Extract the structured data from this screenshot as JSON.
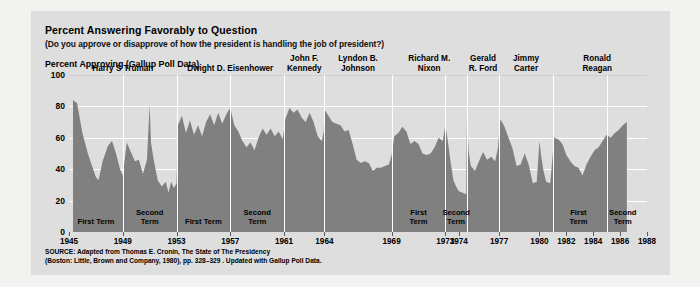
{
  "title": "Percent Answering Favorably to Question",
  "subtitle": "(Do you approve or disapprove of how the president is handling the job of president?)",
  "axis_title": "Percent Approving (Gallup Poll Data)",
  "source": "SOURCE: Adapted from Thomas E. Cronin, The State of The Presidency\n(Boston: Little, Brown and Company, 1980), pp. 328–329 . Updated with Gallup Poll Data.",
  "colors": {
    "page_background": "#f2f2f0",
    "panel_background": "#dedede",
    "area_fill": "#808080",
    "gridline": "#ffffff",
    "text": "#000000"
  },
  "chart_data": {
    "type": "area",
    "title": "Percent Answering Favorably to Question",
    "subtitle": "(Do you approve or disapprove of how the president is handling the job of president?)",
    "xlabel": "",
    "ylabel": "Percent Approving (Gallup Poll Data)",
    "ylim": [
      0,
      100
    ],
    "xlim": [
      1945,
      1988
    ],
    "grid": true,
    "legend": "none",
    "yticks": [
      0,
      20,
      40,
      60,
      80,
      100
    ],
    "xticks": [
      1945,
      1949,
      1953,
      1957,
      1961,
      1964,
      1969,
      1973,
      1974,
      1977,
      1980,
      1982,
      1984,
      1986,
      1988
    ],
    "series_name": "Presidential approval (Gallup)",
    "points": [
      [
        1945.3,
        84
      ],
      [
        1945.6,
        82
      ],
      [
        1946.0,
        63
      ],
      [
        1946.4,
        50
      ],
      [
        1946.8,
        40
      ],
      [
        1947.0,
        35
      ],
      [
        1947.2,
        33
      ],
      [
        1947.5,
        45
      ],
      [
        1947.9,
        55
      ],
      [
        1948.2,
        58
      ],
      [
        1948.5,
        50
      ],
      [
        1948.8,
        40
      ],
      [
        1949.0,
        36
      ],
      [
        1949.3,
        57
      ],
      [
        1949.6,
        51
      ],
      [
        1949.9,
        45
      ],
      [
        1950.2,
        46
      ],
      [
        1950.5,
        37
      ],
      [
        1950.8,
        46
      ],
      [
        1951.0,
        81
      ],
      [
        1951.1,
        57
      ],
      [
        1951.3,
        46
      ],
      [
        1951.6,
        33
      ],
      [
        1951.9,
        29
      ],
      [
        1952.2,
        32
      ],
      [
        1952.4,
        25
      ],
      [
        1952.6,
        32
      ],
      [
        1952.8,
        28
      ],
      [
        1953.0,
        31
      ],
      [
        1953.1,
        68
      ],
      [
        1953.4,
        74
      ],
      [
        1953.7,
        63
      ],
      [
        1954.0,
        71
      ],
      [
        1954.3,
        62
      ],
      [
        1954.6,
        68
      ],
      [
        1954.9,
        61
      ],
      [
        1955.2,
        70
      ],
      [
        1955.5,
        75
      ],
      [
        1955.8,
        68
      ],
      [
        1956.1,
        76
      ],
      [
        1956.4,
        69
      ],
      [
        1956.7,
        75
      ],
      [
        1957.0,
        79
      ],
      [
        1957.3,
        68
      ],
      [
        1957.6,
        64
      ],
      [
        1957.9,
        58
      ],
      [
        1958.2,
        54
      ],
      [
        1958.5,
        57
      ],
      [
        1958.8,
        52
      ],
      [
        1959.1,
        60
      ],
      [
        1959.4,
        66
      ],
      [
        1959.7,
        62
      ],
      [
        1960.0,
        66
      ],
      [
        1960.3,
        61
      ],
      [
        1960.6,
        64
      ],
      [
        1960.9,
        59
      ],
      [
        1961.1,
        72
      ],
      [
        1961.4,
        79
      ],
      [
        1961.7,
        76
      ],
      [
        1962.0,
        78
      ],
      [
        1962.3,
        73
      ],
      [
        1962.6,
        70
      ],
      [
        1962.9,
        76
      ],
      [
        1963.2,
        70
      ],
      [
        1963.5,
        61
      ],
      [
        1963.8,
        58
      ],
      [
        1963.95,
        64
      ],
      [
        1964.0,
        78
      ],
      [
        1964.3,
        74
      ],
      [
        1964.6,
        70
      ],
      [
        1964.9,
        69
      ],
      [
        1965.2,
        68
      ],
      [
        1965.5,
        64
      ],
      [
        1965.8,
        65
      ],
      [
        1966.1,
        56
      ],
      [
        1966.4,
        46
      ],
      [
        1966.7,
        44
      ],
      [
        1967.0,
        45
      ],
      [
        1967.3,
        44
      ],
      [
        1967.6,
        39
      ],
      [
        1967.9,
        41
      ],
      [
        1968.2,
        41
      ],
      [
        1968.5,
        42
      ],
      [
        1968.8,
        43
      ],
      [
        1969.0,
        49
      ],
      [
        1969.2,
        61
      ],
      [
        1969.5,
        63
      ],
      [
        1969.8,
        67
      ],
      [
        1970.1,
        64
      ],
      [
        1970.4,
        56
      ],
      [
        1970.7,
        58
      ],
      [
        1971.0,
        56
      ],
      [
        1971.3,
        50
      ],
      [
        1971.6,
        49
      ],
      [
        1971.9,
        50
      ],
      [
        1972.2,
        54
      ],
      [
        1972.5,
        60
      ],
      [
        1972.8,
        58
      ],
      [
        1973.0,
        68
      ],
      [
        1973.2,
        57
      ],
      [
        1973.4,
        44
      ],
      [
        1973.6,
        33
      ],
      [
        1973.8,
        29
      ],
      [
        1974.0,
        26
      ],
      [
        1974.3,
        25
      ],
      [
        1974.55,
        24
      ],
      [
        1974.6,
        71
      ],
      [
        1974.75,
        50
      ],
      [
        1974.9,
        42
      ],
      [
        1975.2,
        39
      ],
      [
        1975.5,
        45
      ],
      [
        1975.8,
        51
      ],
      [
        1976.1,
        46
      ],
      [
        1976.4,
        48
      ],
      [
        1976.7,
        45
      ],
      [
        1976.9,
        53
      ],
      [
        1977.1,
        72
      ],
      [
        1977.4,
        67
      ],
      [
        1977.7,
        60
      ],
      [
        1978.0,
        53
      ],
      [
        1978.3,
        42
      ],
      [
        1978.6,
        43
      ],
      [
        1978.9,
        50
      ],
      [
        1979.2,
        43
      ],
      [
        1979.5,
        31
      ],
      [
        1979.8,
        32
      ],
      [
        1980.0,
        58
      ],
      [
        1980.15,
        47
      ],
      [
        1980.3,
        39
      ],
      [
        1980.5,
        32
      ],
      [
        1980.8,
        31
      ],
      [
        1981.1,
        60
      ],
      [
        1981.4,
        59
      ],
      [
        1981.7,
        56
      ],
      [
        1982.0,
        49
      ],
      [
        1982.3,
        45
      ],
      [
        1982.6,
        42
      ],
      [
        1982.9,
        41
      ],
      [
        1983.2,
        36
      ],
      [
        1983.5,
        43
      ],
      [
        1983.8,
        48
      ],
      [
        1984.1,
        52
      ],
      [
        1984.4,
        54
      ],
      [
        1984.7,
        58
      ],
      [
        1985.0,
        62
      ],
      [
        1985.3,
        60
      ],
      [
        1985.6,
        63
      ],
      [
        1985.9,
        65
      ],
      [
        1986.2,
        68
      ],
      [
        1986.5,
        70
      ]
    ]
  },
  "presidents": [
    {
      "name": "Harry S Truman",
      "label": "Harry S Truman",
      "start": 1945,
      "end": 1953,
      "center": 1949.0
    },
    {
      "name": "Dwight D. Eisenhower",
      "label": "Dwight D. Eisenhower",
      "start": 1953,
      "end": 1961,
      "center": 1957.0
    },
    {
      "name": "John F. Kennedy",
      "label": "John F.\nKennedy",
      "start": 1961,
      "end": 1964,
      "center": 1962.5
    },
    {
      "name": "Lyndon B. Johnson",
      "label": "Lyndon B.\nJohnson",
      "start": 1964,
      "end": 1969,
      "center": 1966.5
    },
    {
      "name": "Richard M. Nixon",
      "label": "Richard M.\nNixon",
      "start": 1969,
      "end": 1974.6,
      "center": 1971.8
    },
    {
      "name": "Gerald R. Ford",
      "label": "Gerald\nR. Ford",
      "start": 1974.6,
      "end": 1977,
      "center": 1975.8
    },
    {
      "name": "Jimmy Carter",
      "label": "Jimmy\nCarter",
      "start": 1977,
      "end": 1981,
      "center": 1979.0
    },
    {
      "name": "Ronald Reagan",
      "label": "Ronald\nReagan",
      "start": 1981,
      "end": 1988,
      "center": 1984.3
    }
  ],
  "terms": [
    {
      "president": "Harry S Truman",
      "label": "First Term",
      "start": 1945,
      "end": 1949,
      "center": 1947.0
    },
    {
      "president": "Harry S Truman",
      "label": "Second\nTerm",
      "start": 1949,
      "end": 1953,
      "center": 1951.0
    },
    {
      "president": "Dwight D. Eisenhower",
      "label": "First Term",
      "start": 1953,
      "end": 1957,
      "center": 1955.0
    },
    {
      "president": "Dwight D. Eisenhower",
      "label": "Second\nTerm",
      "start": 1957,
      "end": 1961,
      "center": 1959.0
    },
    {
      "president": "Richard M. Nixon",
      "label": "First\nTerm",
      "start": 1969,
      "end": 1973,
      "center": 1971.0
    },
    {
      "president": "Richard M. Nixon",
      "label": "Second\nTerm",
      "start": 1973,
      "end": 1974.6,
      "center": 1973.8
    },
    {
      "president": "Ronald Reagan",
      "label": "First\nTerm",
      "start": 1981,
      "end": 1985,
      "center": 1982.9
    },
    {
      "president": "Ronald Reagan",
      "label": "Second\nTerm",
      "start": 1985,
      "end": 1988,
      "center": 1986.2
    }
  ]
}
